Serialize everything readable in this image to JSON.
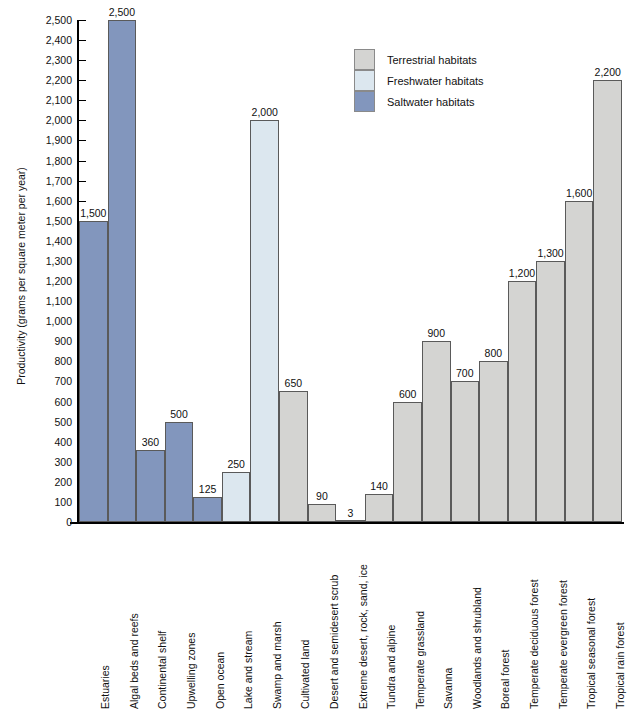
{
  "page": {
    "top_cut_text": "—  —  —  —  —  —  —  —"
  },
  "chart_data": {
    "type": "bar",
    "title": "",
    "xlabel": "",
    "ylabel": "Productivity (grams per square meter per year)",
    "ylim": [
      0,
      2500
    ],
    "ytick_step": 100,
    "grid": false,
    "legend_position": "top-center-right",
    "categories": [
      "Estuaries",
      "Algal beds and reefs",
      "Continental shelf",
      "Upwelling zones",
      "Open ocean",
      "Lake and stream",
      "Swamp and marsh",
      "Cultivated land",
      "Desert and semidesert scrub",
      "Extreme desert, rock, sand, ice",
      "Tundra and alpine",
      "Temperate grassland",
      "Savanna",
      "Woodlands and shrubland",
      "Boreal forest",
      "Temperate deciduous forest",
      "Temperate evergreen forest",
      "Tropical seasonal forest",
      "Tropical rain forest"
    ],
    "values": [
      1500,
      2500,
      360,
      500,
      125,
      250,
      2000,
      650,
      90,
      3,
      140,
      600,
      900,
      700,
      800,
      1200,
      1300,
      1600,
      2200
    ],
    "value_labels": [
      "1,500",
      "2,500",
      "360",
      "500",
      "125",
      "250",
      "2,000",
      "650",
      "90",
      "3",
      "140",
      "600",
      "900",
      "700",
      "800",
      "1,200",
      "1,300",
      "1,600",
      "2,200"
    ],
    "groups": [
      "saltwater",
      "saltwater",
      "saltwater",
      "saltwater",
      "saltwater",
      "freshwater",
      "freshwater",
      "terrestrial",
      "terrestrial",
      "terrestrial",
      "terrestrial",
      "terrestrial",
      "terrestrial",
      "terrestrial",
      "terrestrial",
      "terrestrial",
      "terrestrial",
      "terrestrial",
      "terrestrial"
    ],
    "ytick_labels": [
      "2,500",
      "2,400",
      "2,300",
      "2,200",
      "2,100",
      "2,000",
      "1,900",
      "1,800",
      "1,700",
      "1,600",
      "1,500",
      "1,400",
      "1,300",
      "1,200",
      "1,100",
      "1,000",
      "900",
      "800",
      "700",
      "600",
      "500",
      "400",
      "300",
      "200",
      "100",
      "0"
    ],
    "legend": [
      {
        "label": "Terrestrial habitats",
        "key": "terrestrial",
        "color": "#d4d4d2"
      },
      {
        "label": "Freshwater habitats",
        "key": "freshwater",
        "color": "#dce7ef"
      },
      {
        "label": "Saltwater habitats",
        "key": "saltwater",
        "color": "#8296bd"
      }
    ],
    "colors": {
      "terrestrial": "#d4d4d2",
      "freshwater": "#dce7ef",
      "saltwater": "#8296bd",
      "bar_border": "#5a5a5a",
      "axis": "#000000",
      "text": "#111111",
      "background": "#ffffff"
    }
  }
}
